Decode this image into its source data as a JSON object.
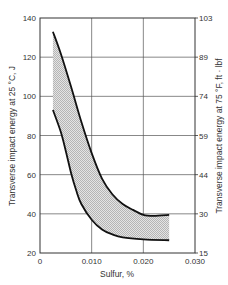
{
  "chart_data": {
    "type": "area",
    "title": "",
    "xlabel": "Sulfur, %",
    "ylabel": "Transverse impact energy at 25 °C, J",
    "ylabel_right": "Transverse impact energy at 75 °F, ft · lbf",
    "xlim": [
      0,
      0.03
    ],
    "ylim": [
      20,
      140
    ],
    "ylim_right": [
      15,
      103
    ],
    "grid": true,
    "x_ticks": [
      "0",
      "0.010",
      "0.020",
      "0.030"
    ],
    "x_tick_values": [
      0,
      0.01,
      0.02,
      0.03
    ],
    "y_ticks": [
      "20",
      "40",
      "60",
      "80",
      "100",
      "120",
      "140"
    ],
    "y_tick_values": [
      20,
      40,
      60,
      80,
      100,
      120,
      140
    ],
    "y_ticks_right": [
      "15",
      "30",
      "44",
      "59",
      "74",
      "89",
      "103"
    ],
    "series": [
      {
        "name": "Upper bound",
        "x": [
          0.0025,
          0.004,
          0.006,
          0.008,
          0.01,
          0.012,
          0.014,
          0.016,
          0.018,
          0.02,
          0.022,
          0.025
        ],
        "values": [
          133,
          122,
          105,
          87,
          71,
          58,
          50,
          45,
          42,
          39.5,
          39,
          39.5
        ]
      },
      {
        "name": "Lower bound",
        "x": [
          0.0025,
          0.004,
          0.005,
          0.006,
          0.007,
          0.008,
          0.01,
          0.012,
          0.014,
          0.016,
          0.02,
          0.025
        ],
        "values": [
          93,
          82,
          72,
          61,
          52,
          45,
          37,
          32,
          29.5,
          28,
          27,
          26.5
        ]
      }
    ],
    "band_fill": "#cfcfcf",
    "line_color": "#111111"
  }
}
